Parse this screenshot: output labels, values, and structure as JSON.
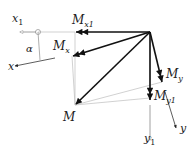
{
  "diagram": {
    "type": "moment vector decomposition with rotated axes",
    "labels": {
      "x1": "x",
      "x1_sub": "1",
      "x": "x",
      "alpha": "α",
      "Mx1": "M",
      "Mx1_sub": "x1",
      "Mx": "M",
      "Mx_sub": "x",
      "My": "M",
      "My_sub": "y",
      "My1": "M",
      "My1_sub": "y1",
      "M": "M",
      "y1": "y",
      "y1_sub": "1",
      "y": "y"
    },
    "colors": {
      "vector": "#111111",
      "axis": "#888888",
      "construction": "#b5b5b5"
    }
  }
}
